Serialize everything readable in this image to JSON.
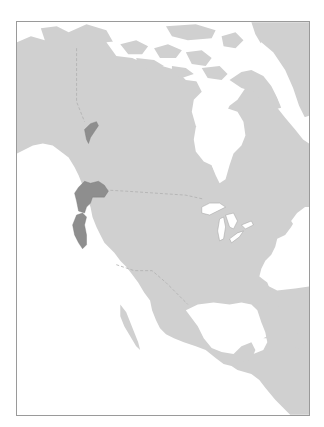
{
  "map": {
    "title": "Species range map — North America",
    "region": "North America",
    "colors": {
      "ocean": "#ffffff",
      "land": "#d0d0d0",
      "range": "#8e8e8e",
      "range_stroke": "#777777",
      "border": "#b0b0b0",
      "lakes": "#ffffff",
      "frame": "#9a9a9a"
    },
    "range_areas": [
      {
        "name": "southern British Columbia / Washington",
        "label": "Range segment 1"
      },
      {
        "name": "Oregon",
        "label": "Range segment 2"
      },
      {
        "name": "northern California coast",
        "label": "Range segment 3"
      }
    ],
    "features": [
      "Hudson Bay",
      "Great Lakes",
      "Gulf of Mexico",
      "Caribbean",
      "Arctic Archipelago",
      "Greenland",
      "Baja California",
      "Florida",
      "Central America"
    ]
  }
}
